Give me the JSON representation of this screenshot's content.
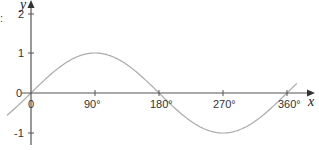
{
  "chart_data": {
    "type": "line",
    "title": "",
    "function": "y = sin x",
    "xlabel": "x",
    "ylabel": "y",
    "x_ticks": [
      "0",
      "90°",
      "180°",
      "270°",
      "360°"
    ],
    "x_tick_values": [
      0,
      90,
      180,
      270,
      360
    ],
    "y_ticks": [
      "-1",
      "0",
      "1",
      "2"
    ],
    "y_tick_values": [
      -1,
      0,
      1,
      2
    ],
    "xlim": [
      -34,
      374
    ],
    "ylim": [
      -1.3,
      2.3
    ],
    "grid": false,
    "legend": null,
    "series": [
      {
        "name": "sin x",
        "x": [
          -34,
          0,
          90,
          180,
          270,
          360,
          374
        ],
        "values": [
          -0.56,
          0,
          1,
          0,
          -1,
          0,
          0.24
        ]
      }
    ],
    "colors": {
      "axis": "#555555",
      "curve": "#aaaaaa"
    }
  },
  "labels": {
    "x_axis": "x",
    "y_axis": "y",
    "x_ticks": [
      "0",
      "90°",
      "180°",
      "270°",
      "360°"
    ],
    "y_tick_2": "2",
    "y_tick_1": "1",
    "y_tick_0": "0",
    "y_tick_neg1": "-1",
    "crop_fragment": ":"
  }
}
